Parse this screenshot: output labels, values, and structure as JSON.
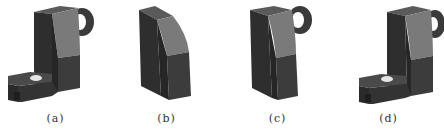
{
  "figure": {
    "panels": [
      {
        "id": "a",
        "label": "(a)",
        "description": "complete bracket part with top lug hole and slotted base"
      },
      {
        "id": "b",
        "label": "(b)",
        "description": "main body block with curved face"
      },
      {
        "id": "c",
        "label": "(c)",
        "description": "body block with top lug and hole added"
      },
      {
        "id": "d",
        "label": "(d)",
        "description": "body with lug and slotted base foot"
      }
    ]
  },
  "colors": {
    "dark_face": "#2e2e2e",
    "mid_face": "#454545",
    "light_face": "#7a7a7a",
    "top_face": "#5a5a5a",
    "background": "#ffffff",
    "caption": "#333333"
  }
}
